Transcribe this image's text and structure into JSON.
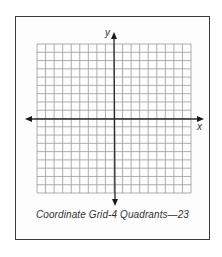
{
  "figure": {
    "caption": "Coordinate Grid-4 Quadrants—23",
    "x_axis_label": "x",
    "y_axis_label": "y"
  },
  "grid": {
    "columns": 18,
    "rows": 18,
    "quadrants": 4,
    "cells_per_quadrant_side": 9,
    "line_color": "#9a9a9a",
    "axis_color": "#2a2a2a",
    "border_color": "#3a3a3a"
  }
}
